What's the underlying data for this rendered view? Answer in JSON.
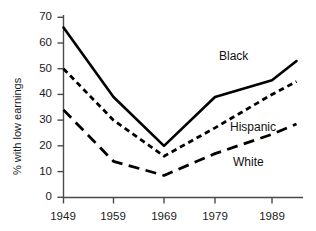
{
  "chart_data": {
    "type": "line",
    "title": "",
    "subtitle": "",
    "xlabel": "",
    "ylabel": "% with low earnings",
    "xlim": [
      1949,
      1993
    ],
    "ylim": [
      0,
      70
    ],
    "grid": false,
    "legend_position": "inline-right-annotations",
    "x": [
      1949,
      1959,
      1969,
      1979,
      1989,
      1993
    ],
    "xtick_labels": [
      "1949",
      "1959",
      "1969",
      "1979",
      "1989"
    ],
    "xtick_values": [
      1949,
      1959,
      1969,
      1979,
      1989
    ],
    "ytick_labels": [
      "0",
      "10",
      "20",
      "30",
      "40",
      "50",
      "60",
      "70"
    ],
    "ytick_values": [
      0,
      10,
      20,
      30,
      40,
      50,
      60,
      70
    ],
    "series": [
      {
        "name": "Black",
        "style": "solid",
        "color": "#000000",
        "values": [
          66,
          39,
          20,
          39,
          45.5,
          53
        ]
      },
      {
        "name": "Hispanic",
        "style": "dotted",
        "color": "#000000",
        "values": [
          50,
          30,
          16,
          27,
          40,
          45
        ]
      },
      {
        "name": "White",
        "style": "dashed",
        "color": "#000000",
        "values": [
          34,
          14,
          8.5,
          17,
          24.5,
          28.5
        ]
      }
    ],
    "annotations": [
      {
        "text": "Black",
        "x": 1979,
        "y": 48
      },
      {
        "text": "Hispanic",
        "x": 1983,
        "y": 28
      },
      {
        "text": "White",
        "x": 1981,
        "y": 14
      }
    ]
  },
  "axis": {
    "y_title": "% with low earnings",
    "y_ticks": [
      "70",
      "60",
      "50",
      "40",
      "30",
      "20",
      "10",
      "0"
    ],
    "x_ticks": [
      "1949",
      "1959",
      "1969",
      "1979",
      "1989"
    ]
  },
  "labels": {
    "black": "Black",
    "hispanic": "Hispanic",
    "white": "White"
  },
  "colors": {
    "line": "#000000",
    "axis": "#4a4a4a",
    "text": "#1a1a1a",
    "background": "#ffffff"
  }
}
